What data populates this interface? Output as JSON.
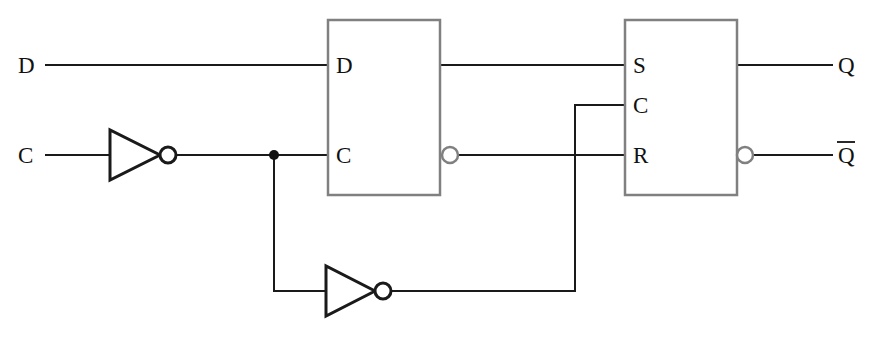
{
  "diagram": {
    "type": "logic-circuit-schematic",
    "background_color": "#ffffff",
    "wire_color": "#1a1a1a",
    "block_border_color": "#808080",
    "label_color": "#111111"
  },
  "inputs": [
    {
      "id": "in-d",
      "label": "D",
      "x": 26,
      "y": 65
    },
    {
      "id": "in-c",
      "label": "C",
      "x": 26,
      "y": 155
    }
  ],
  "outputs": [
    {
      "id": "out-q",
      "label": "Q",
      "overbar": false,
      "x": 846,
      "y": 65
    },
    {
      "id": "out-qbar",
      "label": "Q",
      "overbar": true,
      "x": 846,
      "y": 155
    }
  ],
  "blocks": [
    {
      "id": "block-left-latch",
      "name": "D latch",
      "x": 328,
      "y": 20,
      "w": 112,
      "h": 175,
      "input_pins": [
        {
          "label": "D",
          "y": 65
        },
        {
          "label": "C",
          "y": 155
        }
      ],
      "output_pins": [
        {
          "label": "",
          "y": 65,
          "inverted": false
        },
        {
          "label": "",
          "y": 155,
          "inverted": true
        }
      ]
    },
    {
      "id": "block-right-latch",
      "name": "SR latch",
      "x": 625,
      "y": 20,
      "w": 112,
      "h": 175,
      "input_pins": [
        {
          "label": "S",
          "y": 65
        },
        {
          "label": "C",
          "y": 105
        },
        {
          "label": "R",
          "y": 155
        }
      ],
      "output_pins": [
        {
          "label": "",
          "y": 65,
          "inverted": false
        },
        {
          "label": "",
          "y": 155,
          "inverted": true
        }
      ]
    }
  ],
  "inverters": [
    {
      "id": "inverter-clock-1",
      "x": 108,
      "y": 130,
      "w": 52,
      "h": 50,
      "bubble_r": 8
    },
    {
      "id": "inverter-clock-2",
      "x": 325,
      "y": 266,
      "w": 50,
      "h": 50,
      "bubble_r": 8
    }
  ],
  "junctions": [
    {
      "id": "junction-clock-tap",
      "x": 274,
      "y": 155,
      "r": 5
    }
  ],
  "nets": [
    {
      "id": "net-d-in",
      "points": "46,65 328,65"
    },
    {
      "id": "net-q1-to-s",
      "points": "440,65 625,65"
    },
    {
      "id": "net-q-out",
      "points": "737,65 832,65"
    },
    {
      "id": "net-c-in",
      "points": "46,155 108,155"
    },
    {
      "id": "net-inv1-to-c",
      "points": "176,155 328,155"
    },
    {
      "id": "net-nq1-to-r",
      "points": "458,155 625,155"
    },
    {
      "id": "net-nq-out",
      "points": "753,155 832,155"
    },
    {
      "id": "net-tap-down",
      "points": "274,155 274,291"
    },
    {
      "id": "net-tap-to-inv2",
      "points": "274,291 325,291"
    },
    {
      "id": "net-inv2-out-right",
      "points": "391,291 575,291"
    },
    {
      "id": "net-feedback-up",
      "points": "575,291 575,105"
    },
    {
      "id": "net-feedback-to-c2",
      "points": "575,105 625,105"
    }
  ]
}
